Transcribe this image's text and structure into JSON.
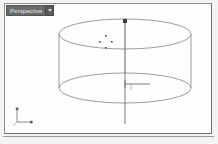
{
  "viewport": {
    "label": "Perspective",
    "dropdown_icon": "chevron-down-icon",
    "background_color": "#fdfdfd",
    "border_color": "#8d8d8d",
    "label_bg_color": "#6b6b6b",
    "label_text_color": "#e8e8e8"
  },
  "scene": {
    "object_name": "Cylinder",
    "wireframe_color": "#8a8a8a",
    "display_mode": "wireframe",
    "top_ellipse": {
      "cx": 120,
      "cy": 30,
      "rx": 66,
      "ry": 15
    },
    "bottom_ellipse": {
      "cx": 120,
      "cy": 84,
      "rx": 66,
      "ry": 15
    }
  },
  "gizmo": {
    "type": "move-gizmo",
    "color": "#6e6e6e",
    "z_axis_label": "Z",
    "x_axis_label": "X",
    "origin": {
      "x": 120,
      "y": 84
    }
  },
  "cursor": {
    "type": "move-cursor",
    "x": 101,
    "y": 38,
    "color": "#4a4a4a"
  },
  "axis_tripod": {
    "name": "world-axis-tripod",
    "z_label": "Z",
    "x_label": "X",
    "y_label": "Y",
    "color": "#7a7a7a",
    "x": 14,
    "y": 112
  }
}
